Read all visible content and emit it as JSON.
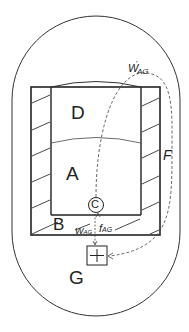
{
  "diagram": {
    "labels": {
      "D": "D",
      "A": "A",
      "B": "B",
      "C": "C",
      "F": "F",
      "G": "G",
      "w_prime_AG": "w'AG",
      "w_prime_AG_main": "W",
      "w_prime_AG_sup": "'",
      "w_prime_AG_sub": "AG",
      "w_AG_main": "W",
      "w_AG_sub": "AG",
      "f_AG_main": "f",
      "f_AG_sub": "AG",
      "G_symbol": "+"
    },
    "colors": {
      "line": "#2a2a2a",
      "background": "#ffffff"
    }
  }
}
